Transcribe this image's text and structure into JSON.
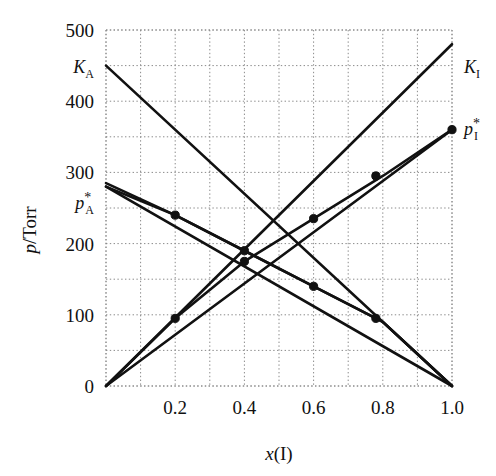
{
  "figure": {
    "background": "#ffffff",
    "line_color": "#111111",
    "grid_color": "#8a8a8a"
  },
  "axes": {
    "y_title_main": "p",
    "y_title_slash": "/Torr",
    "x_title_main": "x",
    "x_title_paren": "(I)",
    "y_ticks": [
      "0",
      "100",
      "200",
      "300",
      "400",
      "500"
    ],
    "x_ticks": [
      "0.2",
      "0.4",
      "0.6",
      "0.8",
      "1.0"
    ],
    "y_min": 0,
    "y_max": 500,
    "x_min": 0,
    "x_max": 1.0,
    "y_major_step": 100,
    "y_minor_step": 50,
    "x_minor_step": 0.1,
    "grid": "dotted"
  },
  "labels": {
    "k_a": {
      "base": "K",
      "sub": "A"
    },
    "k_i": {
      "base": "K",
      "sub": "I"
    },
    "p_a_star": {
      "base": "p",
      "sub": "A",
      "sup": "*"
    },
    "p_i_star": {
      "base": "p",
      "sub": "I",
      "sup": "*"
    }
  },
  "chart_data": {
    "type": "line",
    "title": "",
    "xlabel": "x(I)",
    "ylabel": "p/Torr",
    "xlim": [
      0,
      1.0
    ],
    "ylim": [
      0,
      500
    ],
    "grid": true,
    "legend_position": "inline-end-labels",
    "x_ticks": [
      0.2,
      0.4,
      0.6,
      0.8,
      1.0
    ],
    "y_ticks": [
      0,
      100,
      200,
      300,
      400,
      500
    ],
    "series": [
      {
        "name": "K_A",
        "label": "KA",
        "description": "Henry's law line for component A, tangent to p_A at x(I)=1; straight line from (0,450) to (1.0,0)",
        "x": [
          0.0,
          1.0
        ],
        "values": [
          450,
          0
        ],
        "marker": "none",
        "annotation": "K_A"
      },
      {
        "name": "K_I",
        "label": "KI",
        "description": "Henry's law line for component I, tangent to p_I at x(I)=0; straight line from (0,0) to (1.0,480)",
        "x": [
          0.0,
          1.0
        ],
        "values": [
          0,
          480
        ],
        "marker": "none",
        "annotation": "K_I"
      },
      {
        "name": "p_A_star",
        "label": "pA*",
        "description": "Raoult's law line for A: straight from (0,280) to (1.0,0)",
        "x": [
          0.0,
          1.0
        ],
        "values": [
          280,
          0
        ],
        "marker": "none",
        "annotation": "p_A*"
      },
      {
        "name": "p_I_star",
        "label": "pI*",
        "description": "Raoult's law line for I: straight from (0,0) to (1.0,360)",
        "x": [
          0.0,
          1.0
        ],
        "values": [
          0,
          360
        ],
        "marker": "none",
        "annotation": "p_I*"
      },
      {
        "name": "p_A_experimental",
        "label": "partial pressure A (measured)",
        "description": "Measured partial vapour pressure of A, curving below Raoult line at high x(I)",
        "x": [
          0.0,
          0.2,
          0.4,
          0.6,
          0.8,
          1.0
        ],
        "values": [
          280,
          240,
          190,
          140,
          90,
          0
        ],
        "marker": "filled-circle"
      },
      {
        "name": "p_I_experimental",
        "label": "partial pressure I (measured)",
        "description": "Measured partial vapour pressure of I, rising from origin to p_I*",
        "x": [
          0.0,
          0.2,
          0.4,
          0.6,
          0.8,
          1.0
        ],
        "values": [
          0,
          95,
          175,
          235,
          295,
          360
        ],
        "marker": "filled-circle"
      },
      {
        "name": "p_total_experimental",
        "label": "total vapour pressure (measured)",
        "description": "Total pressure curve descending from p_A* region through the crossing cluster near x(I)=0.4",
        "x": [
          0.0,
          0.2,
          0.4,
          0.6,
          0.8,
          1.0
        ],
        "values": [
          285,
          240,
          190,
          140,
          90,
          0
        ],
        "marker": "filled-circle"
      }
    ],
    "data_points": [
      {
        "x": 0.2,
        "y": 240,
        "series": "p_A_experimental"
      },
      {
        "x": 0.4,
        "y": 190,
        "series": "p_A_experimental"
      },
      {
        "x": 0.2,
        "y": 95,
        "series": "p_I_experimental"
      },
      {
        "x": 0.4,
        "y": 175,
        "series": "p_I_experimental"
      },
      {
        "x": 0.6,
        "y": 235,
        "series": "p_I_experimental"
      },
      {
        "x": 0.78,
        "y": 295,
        "series": "p_I_experimental"
      },
      {
        "x": 1.0,
        "y": 360,
        "series": "p_I_experimental"
      },
      {
        "x": 0.6,
        "y": 140,
        "series": "p_A_experimental"
      },
      {
        "x": 0.78,
        "y": 95,
        "series": "p_A_experimental"
      }
    ]
  }
}
